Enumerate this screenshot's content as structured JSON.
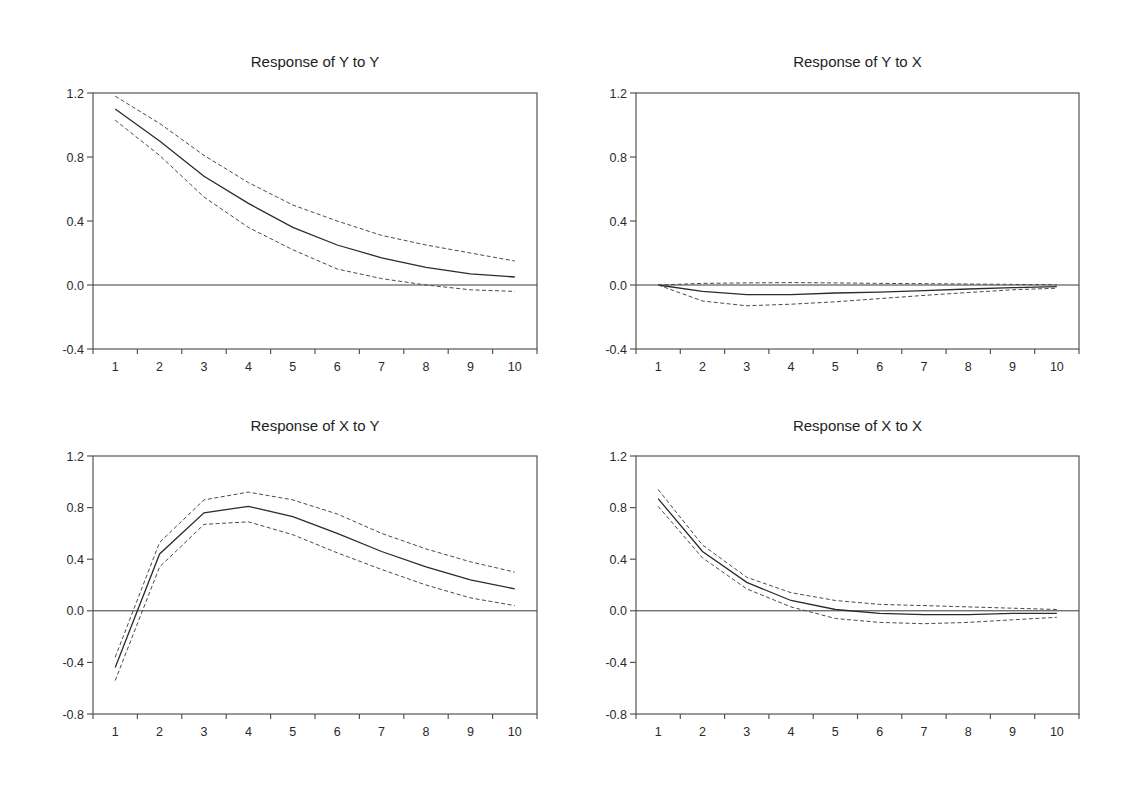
{
  "figure": {
    "colors": {
      "background": "#ffffff",
      "response_line": "#2b2b2b",
      "band_line": "#4a4a4a",
      "axis": "#555555"
    }
  },
  "panels": [
    {
      "title": "Response of Y to Y"
    },
    {
      "title": "Response of Y to X"
    },
    {
      "title": "Response of X to Y"
    },
    {
      "title": "Response of X to X"
    }
  ],
  "chart_data": [
    {
      "type": "line",
      "title": "Response of Y to Y",
      "xlabel": "",
      "ylabel": "",
      "x": [
        1,
        2,
        3,
        4,
        5,
        6,
        7,
        8,
        9,
        10
      ],
      "categories": [
        "1",
        "2",
        "3",
        "4",
        "5",
        "6",
        "7",
        "8",
        "9",
        "10"
      ],
      "ylim": [
        -0.4,
        1.2
      ],
      "yticks": [
        1.2,
        0.8,
        0.4,
        0.0,
        -0.4
      ],
      "ytick_labels": [
        "1.2",
        "0.8",
        "0.4",
        "0.0",
        "-0.4"
      ],
      "grid": false,
      "zero_line": true,
      "legend": "none",
      "series": [
        {
          "name": "response",
          "style": "solid",
          "values": [
            1.1,
            0.9,
            0.68,
            0.51,
            0.36,
            0.25,
            0.17,
            0.11,
            0.07,
            0.05
          ]
        },
        {
          "name": "upper band (+2 S.E.)",
          "style": "dashed",
          "values": [
            1.18,
            1.01,
            0.81,
            0.64,
            0.5,
            0.4,
            0.31,
            0.25,
            0.2,
            0.15
          ]
        },
        {
          "name": "lower band (-2 S.E.)",
          "style": "dashed",
          "values": [
            1.03,
            0.81,
            0.55,
            0.36,
            0.22,
            0.1,
            0.04,
            0.0,
            -0.03,
            -0.04
          ]
        }
      ]
    },
    {
      "type": "line",
      "title": "Response of Y to X",
      "xlabel": "",
      "ylabel": "",
      "x": [
        1,
        2,
        3,
        4,
        5,
        6,
        7,
        8,
        9,
        10
      ],
      "categories": [
        "1",
        "2",
        "3",
        "4",
        "5",
        "6",
        "7",
        "8",
        "9",
        "10"
      ],
      "ylim": [
        -0.4,
        1.2
      ],
      "yticks": [
        1.2,
        0.8,
        0.4,
        0.0,
        -0.4
      ],
      "ytick_labels": [
        "1.2",
        "0.8",
        "0.4",
        "0.0",
        "-0.4"
      ],
      "grid": false,
      "zero_line": true,
      "legend": "none",
      "series": [
        {
          "name": "response",
          "style": "solid",
          "values": [
            0.0,
            -0.04,
            -0.06,
            -0.06,
            -0.05,
            -0.045,
            -0.035,
            -0.025,
            -0.017,
            -0.01
          ]
        },
        {
          "name": "upper band (+2 S.E.)",
          "style": "dashed",
          "values": [
            0.0,
            0.01,
            0.013,
            0.015,
            0.013,
            0.01,
            0.008,
            0.006,
            0.004,
            0.002
          ]
        },
        {
          "name": "lower band (-2 S.E.)",
          "style": "dashed",
          "values": [
            0.0,
            -0.1,
            -0.13,
            -0.12,
            -0.105,
            -0.085,
            -0.065,
            -0.047,
            -0.03,
            -0.02
          ]
        }
      ]
    },
    {
      "type": "line",
      "title": "Response of X to Y",
      "xlabel": "",
      "ylabel": "",
      "x": [
        1,
        2,
        3,
        4,
        5,
        6,
        7,
        8,
        9,
        10
      ],
      "categories": [
        "1",
        "2",
        "3",
        "4",
        "5",
        "6",
        "7",
        "8",
        "9",
        "10"
      ],
      "ylim": [
        -0.8,
        1.2
      ],
      "yticks": [
        1.2,
        0.8,
        0.4,
        0.0,
        -0.4,
        -0.8
      ],
      "ytick_labels": [
        "1.2",
        "0.8",
        "0.4",
        "0.0",
        "-0.4",
        "-0.8"
      ],
      "grid": false,
      "zero_line": true,
      "legend": "none",
      "series": [
        {
          "name": "response",
          "style": "solid",
          "values": [
            -0.44,
            0.44,
            0.76,
            0.81,
            0.73,
            0.6,
            0.46,
            0.34,
            0.24,
            0.17
          ]
        },
        {
          "name": "upper band (+2 S.E.)",
          "style": "dashed",
          "values": [
            -0.36,
            0.53,
            0.86,
            0.92,
            0.86,
            0.75,
            0.6,
            0.48,
            0.38,
            0.3
          ]
        },
        {
          "name": "lower band (-2 S.E.)",
          "style": "dashed",
          "values": [
            -0.54,
            0.34,
            0.67,
            0.69,
            0.59,
            0.45,
            0.32,
            0.2,
            0.1,
            0.04
          ]
        }
      ]
    },
    {
      "type": "line",
      "title": "Response of X to X",
      "xlabel": "",
      "ylabel": "",
      "x": [
        1,
        2,
        3,
        4,
        5,
        6,
        7,
        8,
        9,
        10
      ],
      "categories": [
        "1",
        "2",
        "3",
        "4",
        "5",
        "6",
        "7",
        "8",
        "9",
        "10"
      ],
      "ylim": [
        -0.8,
        1.2
      ],
      "yticks": [
        1.2,
        0.8,
        0.4,
        0.0,
        -0.4,
        -0.8
      ],
      "ytick_labels": [
        "1.2",
        "0.8",
        "0.4",
        "0.0",
        "-0.4",
        "-0.8"
      ],
      "grid": false,
      "zero_line": true,
      "legend": "none",
      "series": [
        {
          "name": "response",
          "style": "solid",
          "values": [
            0.87,
            0.46,
            0.22,
            0.08,
            0.01,
            -0.02,
            -0.03,
            -0.03,
            -0.02,
            -0.02
          ]
        },
        {
          "name": "upper band (+2 S.E.)",
          "style": "dashed",
          "values": [
            0.94,
            0.51,
            0.26,
            0.14,
            0.08,
            0.05,
            0.04,
            0.03,
            0.02,
            0.01
          ]
        },
        {
          "name": "lower band (-2 S.E.)",
          "style": "dashed",
          "values": [
            0.81,
            0.41,
            0.17,
            0.03,
            -0.06,
            -0.09,
            -0.1,
            -0.09,
            -0.07,
            -0.05
          ]
        }
      ]
    }
  ]
}
